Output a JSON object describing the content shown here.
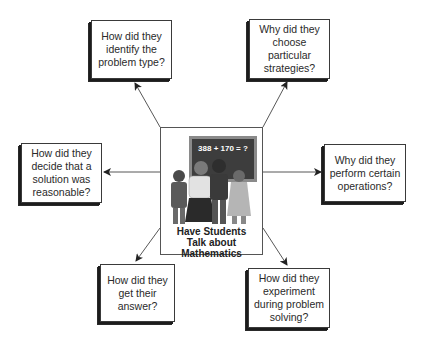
{
  "diagram": {
    "center": {
      "title": "Have Students\nTalk about\nMathematics",
      "equation": "388 + 170 = ?",
      "image": "students-at-chalkboard-illustration"
    },
    "questions": [
      {
        "id": "top-left",
        "text": "How did they\nidentify the\nproblem type?"
      },
      {
        "id": "top-right",
        "text": "Why did they\nchoose\nparticular\nstrategies?"
      },
      {
        "id": "left",
        "text": "How did they\ndecide that a\nsolution was\nreasonable?"
      },
      {
        "id": "right",
        "text": "Why did they\nperform certain\noperations?"
      },
      {
        "id": "bottom-left",
        "text": "How did they\nget their\nanswer?"
      },
      {
        "id": "bottom-right",
        "text": "How did they\nexperiment\nduring problem\nsolving?"
      }
    ],
    "colors": {
      "line": "#333333",
      "box_border": "#3a3a3a",
      "shadow": "#1c1c1c",
      "chalkboard": "#3d3d3d"
    }
  }
}
